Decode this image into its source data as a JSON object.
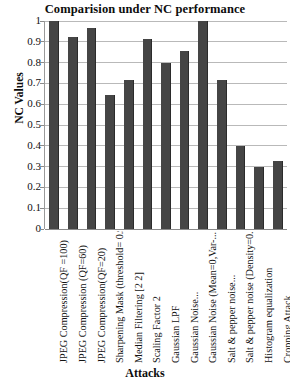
{
  "chart_data": {
    "type": "bar",
    "title": "Comparision under NC performance",
    "xlabel": "Attacks",
    "ylabel": "NC Values",
    "ylim": [
      0,
      1
    ],
    "ytick_labels": [
      "1",
      "0.9",
      "0.8",
      "0.7",
      "0.6",
      "0.5",
      "0.4",
      "0.3",
      "0.2",
      "0.1",
      "0"
    ],
    "ytick_values": [
      1,
      0.9,
      0.8,
      0.7,
      0.6,
      0.5,
      0.4,
      0.3,
      0.2,
      0.1,
      0
    ],
    "grid": true,
    "legend": false,
    "bar_color": "#454545",
    "categories": [
      "JPEG Compression(QF =100)",
      "JPEG Compression (QF=60)",
      "JPEG Compression(QF=20)",
      "Sharpening Mask (threshold= 0.9)",
      "Median Filtering [2 2]",
      "Scaling Factor 2",
      "Gaussian LPF",
      "Gaussian Noise...",
      "Gaussian Noise (Mean=0,Var-...",
      "Salt & pepper noise...",
      "Salt & pepper noise (Density=0.1)",
      "Histogram equalization",
      "Cropping Attack"
    ],
    "values": [
      1.0,
      0.925,
      0.965,
      0.645,
      0.715,
      0.915,
      0.8,
      0.855,
      1.0,
      0.715,
      0.4,
      0.3,
      0.325
    ],
    "series": [
      {
        "name": "NC Values",
        "values": [
          1.0,
          0.925,
          0.965,
          0.645,
          0.715,
          0.915,
          0.8,
          0.855,
          1.0,
          0.715,
          0.4,
          0.3,
          0.325
        ]
      }
    ],
    "bars": [
      {
        "label": "JPEG Compression(QF =100)",
        "value": 1.0
      },
      {
        "label": "JPEG Compression (QF=60)",
        "value": 0.925
      },
      {
        "label": "JPEG Compression(QF=20)",
        "value": 0.965
      },
      {
        "label": "Sharpening Mask (threshold= 0.9)",
        "value": 0.645
      },
      {
        "label": "Median Filtering [2 2]",
        "value": 0.715
      },
      {
        "label": "Scaling Factor 2",
        "value": 0.915
      },
      {
        "label": "Gaussian LPF",
        "value": 0.8
      },
      {
        "label": "Gaussian Noise...",
        "value": 0.855
      },
      {
        "label": "Gaussian Noise (Mean=0,Var-...",
        "value": 1.0
      },
      {
        "label": "Salt & pepper noise...",
        "value": 0.715
      },
      {
        "label": "Salt & pepper noise (Density=0.1)",
        "value": 0.4
      },
      {
        "label": "Histogram equalization",
        "value": 0.3
      },
      {
        "label": "Cropping Attack",
        "value": 0.325
      }
    ]
  }
}
